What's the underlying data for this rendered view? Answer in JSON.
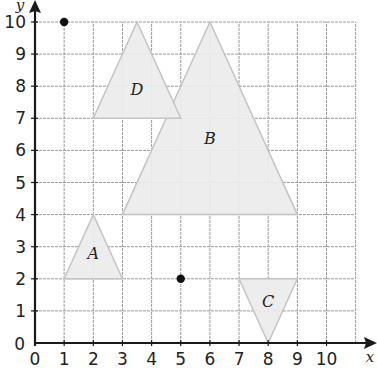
{
  "diagram": {
    "type": "coordinate-grid",
    "x_axis": {
      "label": "x",
      "min": 0,
      "max": 11,
      "ticks": [
        "0",
        "1",
        "2",
        "3",
        "4",
        "5",
        "6",
        "7",
        "8",
        "9",
        "10"
      ]
    },
    "y_axis": {
      "label": "y",
      "min": 0,
      "max": 10,
      "ticks": [
        "0",
        "1",
        "2",
        "3",
        "4",
        "5",
        "6",
        "7",
        "8",
        "9",
        "10"
      ]
    },
    "triangles": [
      {
        "label": "A",
        "vertices": [
          [
            1,
            2
          ],
          [
            3,
            2
          ],
          [
            2,
            4
          ]
        ],
        "label_pos": [
          2,
          2.8
        ]
      },
      {
        "label": "B",
        "vertices": [
          [
            3,
            4
          ],
          [
            9,
            4
          ],
          [
            6,
            10
          ]
        ],
        "label_pos": [
          6,
          6.4
        ]
      },
      {
        "label": "C",
        "vertices": [
          [
            7,
            2
          ],
          [
            9,
            2
          ],
          [
            8,
            0
          ]
        ],
        "label_pos": [
          8,
          1.3
        ]
      },
      {
        "label": "D",
        "vertices": [
          [
            2,
            7
          ],
          [
            5,
            7
          ],
          [
            3.5,
            10
          ]
        ],
        "label_pos": [
          3.5,
          7.9
        ]
      }
    ],
    "points": [
      [
        1,
        10
      ],
      [
        5,
        2
      ]
    ],
    "colors": {
      "grid": "#9a9a9a",
      "fill": "#ececec",
      "edge": "#c4c4c4",
      "axis": "#1a1a1a"
    }
  }
}
